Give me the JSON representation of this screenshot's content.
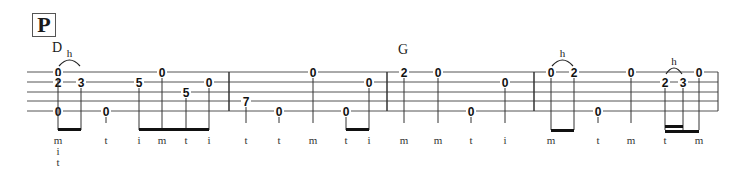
{
  "section": {
    "label": "P"
  },
  "chords": [
    {
      "name": "D",
      "x": 52,
      "y": 42
    },
    {
      "name": "G",
      "x": 398,
      "y": 44
    }
  ],
  "staff": {
    "lines_y": [
      72,
      82,
      92,
      101,
      111
    ],
    "x_start": 27,
    "x_end": 718,
    "barlines_x": [
      229,
      387,
      534,
      718
    ]
  },
  "notes": [
    {
      "x": 58,
      "frets": [
        {
          "string": 1,
          "fret": "0"
        },
        {
          "string": 2,
          "fret": "2"
        },
        {
          "string": 5,
          "fret": "0"
        }
      ],
      "finger": [
        "m",
        "i",
        "t"
      ]
    },
    {
      "x": 81,
      "frets": [
        {
          "string": 2,
          "fret": "3"
        }
      ],
      "finger": []
    },
    {
      "x": 106,
      "frets": [
        {
          "string": 5,
          "fret": "0"
        }
      ],
      "finger": [
        "t"
      ]
    },
    {
      "x": 139,
      "frets": [
        {
          "string": 2,
          "fret": "5"
        }
      ],
      "finger": [
        "i"
      ]
    },
    {
      "x": 162,
      "frets": [
        {
          "string": 1,
          "fret": "0"
        }
      ],
      "finger": [
        "m"
      ]
    },
    {
      "x": 186,
      "frets": [
        {
          "string": 3,
          "fret": "5"
        }
      ],
      "finger": [
        "t"
      ]
    },
    {
      "x": 209,
      "frets": [
        {
          "string": 2,
          "fret": "0"
        }
      ],
      "finger": [
        "i"
      ]
    },
    {
      "x": 246,
      "frets": [
        {
          "string": 4,
          "fret": "7"
        }
      ],
      "finger": [
        "t"
      ]
    },
    {
      "x": 279,
      "frets": [
        {
          "string": 5,
          "fret": "0"
        }
      ],
      "finger": [
        "t"
      ]
    },
    {
      "x": 313,
      "frets": [
        {
          "string": 1,
          "fret": "0"
        }
      ],
      "finger": [
        "m"
      ]
    },
    {
      "x": 346,
      "frets": [
        {
          "string": 5,
          "fret": "0"
        }
      ],
      "finger": [
        "t"
      ]
    },
    {
      "x": 369,
      "frets": [
        {
          "string": 2,
          "fret": "0"
        }
      ],
      "finger": [
        "i"
      ]
    },
    {
      "x": 404,
      "frets": [
        {
          "string": 1,
          "fret": "2"
        }
      ],
      "finger": [
        "m"
      ]
    },
    {
      "x": 438,
      "frets": [
        {
          "string": 1,
          "fret": "0"
        }
      ],
      "finger": [
        "m"
      ]
    },
    {
      "x": 471,
      "frets": [
        {
          "string": 5,
          "fret": "0"
        }
      ],
      "finger": [
        "t"
      ]
    },
    {
      "x": 505,
      "frets": [
        {
          "string": 2,
          "fret": "0"
        }
      ],
      "finger": [
        "i"
      ]
    },
    {
      "x": 551,
      "frets": [
        {
          "string": 1,
          "fret": "0"
        }
      ],
      "finger": [
        "m"
      ]
    },
    {
      "x": 574,
      "frets": [
        {
          "string": 1,
          "fret": "2"
        }
      ],
      "finger": []
    },
    {
      "x": 598,
      "frets": [
        {
          "string": 5,
          "fret": "0"
        }
      ],
      "finger": [
        "t"
      ]
    },
    {
      "x": 631,
      "frets": [
        {
          "string": 1,
          "fret": "0"
        }
      ],
      "finger": [
        "m"
      ]
    },
    {
      "x": 665,
      "frets": [
        {
          "string": 2,
          "fret": "2"
        }
      ],
      "finger": [
        "t"
      ]
    },
    {
      "x": 683,
      "frets": [
        {
          "string": 2,
          "fret": "3"
        }
      ],
      "finger": []
    },
    {
      "x": 699,
      "frets": [
        {
          "string": 1,
          "fret": "0"
        }
      ],
      "finger": [
        "m"
      ]
    }
  ],
  "beams": [
    {
      "x1": 58,
      "x2": 81,
      "y": 128,
      "double": false
    },
    {
      "x1": 139,
      "x2": 209,
      "y": 128,
      "double": false
    },
    {
      "x1": 346,
      "x2": 369,
      "y": 128,
      "double": false
    },
    {
      "x1": 551,
      "x2": 574,
      "y": 129,
      "double": false
    },
    {
      "x1": 665,
      "x2": 699,
      "y": 130,
      "double": false
    },
    {
      "x1": 665,
      "x2": 683,
      "y": 125,
      "double": false
    }
  ],
  "techniques": [
    {
      "label": "h",
      "x1": 58,
      "x2": 81,
      "y": 72
    },
    {
      "label": "h",
      "x1": 551,
      "x2": 574,
      "y": 72
    },
    {
      "label": "h",
      "x1": 665,
      "x2": 683,
      "y": 80
    }
  ]
}
